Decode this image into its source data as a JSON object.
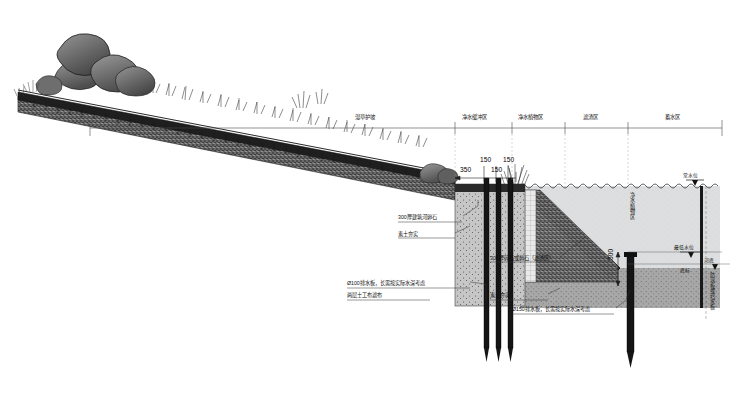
{
  "drawing": {
    "title": "河道生态护坡断面图",
    "zones": [
      {
        "id": "z1",
        "label": "湿草护坡",
        "x": 377,
        "y": 120
      },
      {
        "id": "z2",
        "label": "净水缓冲区",
        "x": 483,
        "y": 120
      },
      {
        "id": "z3",
        "label": "净水植物区",
        "x": 538,
        "y": 120
      },
      {
        "id": "z4",
        "label": "滤渣区",
        "x": 596,
        "y": 120
      },
      {
        "id": "z5",
        "label": "蓄水区",
        "x": 678,
        "y": 120
      }
    ],
    "dimensions": [
      {
        "id": "d1",
        "value": "350",
        "x": 470,
        "y": 170
      },
      {
        "id": "d2",
        "value": "150",
        "x": 487,
        "y": 160
      },
      {
        "id": "d3",
        "value": "150",
        "x": 497,
        "y": 170
      },
      {
        "id": "d4",
        "value": "150",
        "x": 508,
        "y": 160
      },
      {
        "id": "d5",
        "value": "500",
        "x": 620,
        "y": 263
      }
    ],
    "annotations": [
      {
        "id": "a1",
        "text": "300厚建筑河卵石",
        "x": 398,
        "y": 216
      },
      {
        "id": "a2",
        "text": "素土夯实",
        "x": 398,
        "y": 233
      },
      {
        "id": "a3",
        "text": "300厚碎石或卵石（滤渣区）",
        "x": 490,
        "y": 257
      },
      {
        "id": "a4",
        "text": "Ø100排水板，长需按实际水深考虑",
        "x": 347,
        "y": 282
      },
      {
        "id": "a5",
        "text": "两层土工布滤布",
        "x": 347,
        "y": 294
      },
      {
        "id": "a6",
        "text": "素土夯实",
        "x": 490,
        "y": 294
      },
      {
        "id": "a7",
        "text": "Ø150排水板，长需按实际水深考虑",
        "x": 512,
        "y": 308
      }
    ],
    "vertical_labels": [
      {
        "id": "v1",
        "text": "净水植物区",
        "x": 632,
        "y": 195
      },
      {
        "id": "v2",
        "text": "防浪板或挡水板",
        "x": 712,
        "y": 285
      }
    ],
    "water_marks": [
      {
        "id": "w1",
        "text": "常水位",
        "x": 684,
        "y": 170
      },
      {
        "id": "w2",
        "text": "最低水位",
        "x": 676,
        "y": 243
      },
      {
        "id": "w3",
        "text": "河底",
        "x": 702,
        "y": 258
      },
      {
        "id": "w4",
        "text": "底标",
        "x": 680,
        "y": 268
      }
    ],
    "colors": {
      "line": "#2b2b2b",
      "fill_dark": "#1d1d1d",
      "fill_mid": "#6f6f6f",
      "fill_light": "#c9c9c9",
      "water": "#d8dadb",
      "sediment": "#9a9a9a",
      "paper": "#ffffff"
    }
  }
}
